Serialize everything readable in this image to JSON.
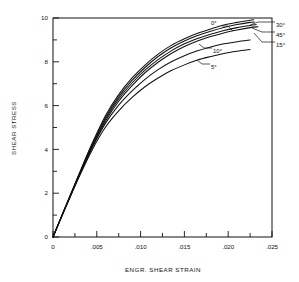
{
  "chart_data": {
    "type": "line",
    "title": "",
    "xlabel": "ENGR. SHEAR STRAIN",
    "ylabel": "SHEAR STRESS",
    "xlim": [
      0,
      0.025
    ],
    "ylim": [
      0,
      10
    ],
    "grid": false,
    "legend": "inline-annotations",
    "x_ticks": [
      0,
      0.005,
      0.01,
      0.015,
      0.02,
      0.025
    ],
    "x_tick_labels": [
      "0",
      ".005",
      ".010",
      ".015",
      ".020",
      ".025"
    ],
    "x_minor_step": 0.0025,
    "y_ticks": [
      0,
      2,
      4,
      6,
      8,
      10
    ],
    "y_tick_labels": [
      "0",
      "2",
      "4",
      "6",
      "8",
      "10"
    ],
    "y_minor_step": 1,
    "series": [
      {
        "name": "0°",
        "label": "0°",
        "x": [
          0,
          0.0015,
          0.003,
          0.0045,
          0.006,
          0.0075,
          0.009,
          0.0105,
          0.012,
          0.0135,
          0.015,
          0.0165,
          0.018,
          0.0195,
          0.021,
          0.0225,
          0.0229
        ],
        "y": [
          0,
          1.45,
          2.9,
          4.3,
          5.55,
          6.5,
          7.25,
          7.85,
          8.35,
          8.75,
          9.05,
          9.3,
          9.5,
          9.68,
          9.8,
          9.9,
          9.92
        ]
      },
      {
        "name": "30°",
        "label": "30°",
        "x": [
          0,
          0.0015,
          0.003,
          0.0045,
          0.006,
          0.0075,
          0.009,
          0.0105,
          0.012,
          0.0135,
          0.015,
          0.0165,
          0.018,
          0.0195,
          0.021,
          0.0225,
          0.023
        ],
        "y": [
          0,
          1.45,
          2.88,
          4.26,
          5.46,
          6.4,
          7.14,
          7.74,
          8.24,
          8.64,
          8.95,
          9.2,
          9.4,
          9.57,
          9.7,
          9.8,
          9.82
        ]
      },
      {
        "name": "45°",
        "label": "45°",
        "x": [
          0,
          0.0015,
          0.003,
          0.0045,
          0.006,
          0.0075,
          0.009,
          0.0105,
          0.012,
          0.0135,
          0.015,
          0.0165,
          0.018,
          0.0195,
          0.021,
          0.0225,
          0.0232
        ],
        "y": [
          0,
          1.44,
          2.85,
          4.2,
          5.38,
          6.3,
          7.02,
          7.62,
          8.1,
          8.5,
          8.82,
          9.06,
          9.26,
          9.43,
          9.56,
          9.66,
          9.7
        ]
      },
      {
        "name": "15°",
        "label": "15°",
        "x": [
          0,
          0.0015,
          0.003,
          0.0045,
          0.006,
          0.0075,
          0.009,
          0.0105,
          0.012,
          0.0135,
          0.015,
          0.0165,
          0.018,
          0.0195,
          0.021,
          0.0225,
          0.0234
        ],
        "y": [
          0,
          1.43,
          2.82,
          4.14,
          5.3,
          6.2,
          6.9,
          7.5,
          7.98,
          8.38,
          8.7,
          8.95,
          9.15,
          9.32,
          9.45,
          9.56,
          9.6
        ]
      },
      {
        "name": "10°",
        "label": "10°",
        "x": [
          0,
          0.0015,
          0.003,
          0.0045,
          0.006,
          0.0075,
          0.009,
          0.0105,
          0.012,
          0.0135,
          0.015,
          0.0165,
          0.018,
          0.0195,
          0.021,
          0.0225
        ],
        "y": [
          0,
          1.42,
          2.8,
          4.1,
          5.2,
          6.02,
          6.66,
          7.2,
          7.64,
          8.0,
          8.28,
          8.5,
          8.68,
          8.82,
          8.92,
          9.0
        ]
      },
      {
        "name": "5°",
        "label": "5°",
        "x": [
          0,
          0.0015,
          0.003,
          0.0045,
          0.006,
          0.0075,
          0.009,
          0.0105,
          0.012,
          0.0135,
          0.015,
          0.0165,
          0.018,
          0.0195,
          0.021,
          0.0225
        ],
        "y": [
          0,
          1.4,
          2.76,
          4.0,
          5.02,
          5.76,
          6.36,
          6.86,
          7.26,
          7.6,
          7.86,
          8.08,
          8.24,
          8.38,
          8.48,
          8.56
        ]
      }
    ],
    "annotations": [
      {
        "label": "0°",
        "text_x": 213,
        "text_y": 24
      },
      {
        "label": "30°",
        "text_x": 277,
        "text_y": 24
      },
      {
        "label": "45°",
        "text_x": 277,
        "text_y": 34
      },
      {
        "label": "15°",
        "text_x": 277,
        "text_y": 44
      },
      {
        "label": "10°",
        "text_x": 214,
        "text_y": 50
      },
      {
        "label": "5°",
        "text_x": 212,
        "text_y": 66
      }
    ],
    "colors": {
      "line": "#111111",
      "background": "#ffffff",
      "axis": "#111111"
    }
  }
}
